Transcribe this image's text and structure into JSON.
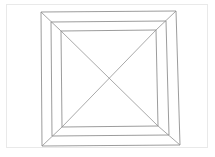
{
  "figure": {
    "background_color": "#ffffff",
    "line_color": "#8a8a8a",
    "frame_color": "#e9e9e9",
    "canvas": {
      "width": 215,
      "height": 157
    }
  },
  "page_frame": {
    "name": "page-border",
    "x": 6.5,
    "y": 4.5,
    "width": 201,
    "height": 143,
    "stroke": "#e9e9e9"
  },
  "shapes": {
    "square_outer": {
      "label": "outer-square",
      "points": "41,12 176,11 180,145 42,146"
    },
    "square_middle": {
      "label": "middle-square",
      "points": "51,22 166,21 169,135 52,136"
    },
    "square_inner": {
      "label": "inner-square",
      "points": "61,31 156,30 158,126 62,127"
    },
    "corner_diagonals": [
      {
        "label": "corner-diagonal-top-left",
        "x1": 41,
        "y1": 12,
        "x2": 61,
        "y2": 31
      },
      {
        "label": "corner-diagonal-top-right",
        "x1": 176,
        "y1": 11,
        "x2": 156,
        "y2": 30
      },
      {
        "label": "corner-diagonal-bottom-right",
        "x1": 180,
        "y1": 145,
        "x2": 158,
        "y2": 126
      },
      {
        "label": "corner-diagonal-bottom-left",
        "x1": 42,
        "y1": 146,
        "x2": 62,
        "y2": 127
      }
    ],
    "inner_diagonals": [
      {
        "label": "inner-diagonal-tl-br",
        "x1": 61,
        "y1": 31,
        "x2": 158,
        "y2": 126
      },
      {
        "label": "inner-diagonal-tr-bl",
        "x1": 156,
        "y1": 30,
        "x2": 62,
        "y2": 127
      }
    ],
    "center_point": {
      "label": "diagonal-intersection",
      "x": 109.5,
      "y": 78.5
    }
  }
}
